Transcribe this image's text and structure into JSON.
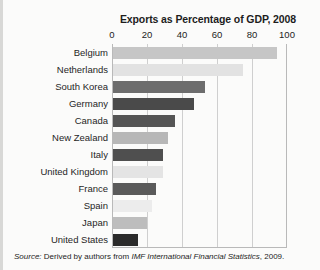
{
  "figure": {
    "title": "Exports as Percentage of GDP, 2008",
    "source_prefix": "Source:",
    "source_text": "Derived by authors from",
    "source_italic": "IMF International Financial Statistics",
    "source_year": ", 2009."
  },
  "chart_data": {
    "type": "bar",
    "orientation": "horizontal",
    "title": "Exports as Percentage of GDP, 2008",
    "xlabel": "",
    "ylabel": "",
    "xlim": [
      0,
      100
    ],
    "xticks": [
      0,
      20,
      40,
      60,
      80,
      100
    ],
    "xtick_labels": [
      "0",
      "20",
      "40",
      "60",
      "80",
      "100"
    ],
    "grid": true,
    "legend": false,
    "categories": [
      "Belgium",
      "Netherlands",
      "South Korea",
      "Germany",
      "Canada",
      "New Zealand",
      "Italy",
      "United Kingdom",
      "France",
      "Spain",
      "Japan",
      "United States"
    ],
    "values": [
      94,
      75,
      53,
      47,
      36,
      32,
      29,
      29,
      25,
      23,
      20,
      15
    ],
    "bar_colors": [
      "#c6c6c6",
      "#e2e2e2",
      "#6d6d6d",
      "#4a4a4a",
      "#555555",
      "#b7b7b7",
      "#4f4f4f",
      "#e4e4e4",
      "#5a5a5a",
      "#ececec",
      "#bdbdbd",
      "#2b2b2b"
    ]
  }
}
